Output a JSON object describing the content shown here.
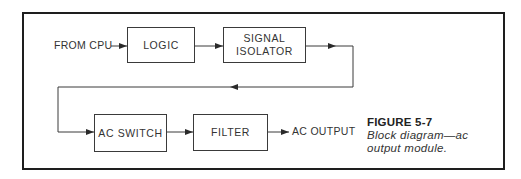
{
  "diagram": {
    "blocks": {
      "logic": "LOGIC",
      "signal_isolator_line1": "SIGNAL",
      "signal_isolator_line2": "ISOLATOR",
      "ac_switch": "AC SWITCH",
      "filter": "FILTER"
    },
    "input_label": "FROM CPU",
    "output_label": "AC OUTPUT",
    "flow": [
      "FROM CPU",
      "LOGIC",
      "SIGNAL ISOLATOR",
      "AC SWITCH",
      "FILTER",
      "AC OUTPUT"
    ]
  },
  "caption": {
    "title": "FIGURE 5-7",
    "text_line1": "Block diagram—ac",
    "text_line2": "output module."
  },
  "colors": {
    "line": "#3a3a3a",
    "frame": "#1e1e1e",
    "background": "#ffffff"
  }
}
